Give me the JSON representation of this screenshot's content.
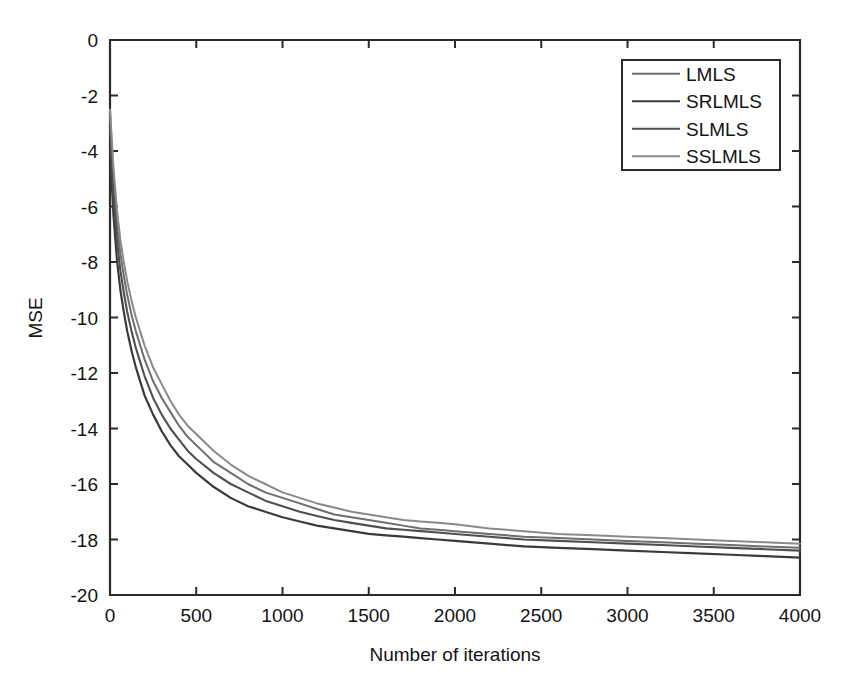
{
  "chart_data": {
    "type": "line",
    "title": "",
    "xlabel": "Number of iterations",
    "ylabel": "MSE",
    "xlim": [
      0,
      4000
    ],
    "ylim": [
      -20,
      0
    ],
    "xticks": [
      0,
      500,
      1000,
      1500,
      2000,
      2500,
      3000,
      3500,
      4000
    ],
    "xtick_labels": [
      "0",
      "500",
      "1000",
      "1500",
      "2000",
      "2500",
      "3000",
      "3500",
      "4000"
    ],
    "yticks": [
      0,
      -2,
      -4,
      -6,
      -8,
      -10,
      -12,
      -14,
      -16,
      -18,
      -20
    ],
    "ytick_labels": [
      "0",
      "-2",
      "-4",
      "-6",
      "-8",
      "-10",
      "-12",
      "-14",
      "-16",
      "-18",
      "-20"
    ],
    "grid": false,
    "legend_position": "upper right",
    "x": [
      0,
      20,
      40,
      60,
      80,
      100,
      125,
      150,
      175,
      200,
      250,
      300,
      350,
      400,
      450,
      500,
      600,
      700,
      800,
      900,
      1000,
      1100,
      1200,
      1300,
      1400,
      1500,
      1600,
      1700,
      1800,
      1900,
      2000,
      2200,
      2400,
      2600,
      2800,
      3000,
      3200,
      3400,
      3600,
      3800,
      4000
    ],
    "series": [
      {
        "name": "LMLS",
        "color": "#6e6e6e",
        "width": 2.0,
        "values": [
          -2.6,
          -5.0,
          -6.6,
          -7.7,
          -8.5,
          -9.2,
          -9.9,
          -10.5,
          -11.0,
          -11.5,
          -12.3,
          -12.9,
          -13.4,
          -13.9,
          -14.3,
          -14.6,
          -15.2,
          -15.6,
          -16.0,
          -16.3,
          -16.5,
          -16.7,
          -16.9,
          -17.1,
          -17.2,
          -17.3,
          -17.4,
          -17.5,
          -17.6,
          -17.65,
          -17.7,
          -17.8,
          -17.9,
          -17.95,
          -18.0,
          -18.05,
          -18.1,
          -18.15,
          -18.2,
          -18.25,
          -18.3
        ]
      },
      {
        "name": "SRLMLS",
        "color": "#3a3a3a",
        "width": 2.2,
        "values": [
          -3.9,
          -6.3,
          -7.9,
          -9.0,
          -9.8,
          -10.5,
          -11.2,
          -11.8,
          -12.3,
          -12.8,
          -13.5,
          -14.1,
          -14.6,
          -15.0,
          -15.3,
          -15.6,
          -16.1,
          -16.5,
          -16.8,
          -17.0,
          -17.2,
          -17.35,
          -17.5,
          -17.6,
          -17.7,
          -17.8,
          -17.85,
          -17.9,
          -17.95,
          -18.0,
          -18.05,
          -18.15,
          -18.25,
          -18.3,
          -18.35,
          -18.4,
          -18.45,
          -18.5,
          -18.55,
          -18.6,
          -18.65
        ]
      },
      {
        "name": "SLMLS",
        "color": "#4f4f4f",
        "width": 2.1,
        "values": [
          -3.2,
          -5.6,
          -7.2,
          -8.3,
          -9.1,
          -9.8,
          -10.5,
          -11.1,
          -11.6,
          -12.1,
          -12.9,
          -13.5,
          -14.0,
          -14.4,
          -14.8,
          -15.1,
          -15.6,
          -16.0,
          -16.3,
          -16.6,
          -16.8,
          -17.0,
          -17.15,
          -17.3,
          -17.4,
          -17.5,
          -17.6,
          -17.65,
          -17.7,
          -17.75,
          -17.8,
          -17.9,
          -18.0,
          -18.05,
          -18.1,
          -18.15,
          -18.2,
          -18.25,
          -18.3,
          -18.35,
          -18.4
        ]
      },
      {
        "name": "SSLMLS",
        "color": "#8a8a8a",
        "width": 2.0,
        "values": [
          -2.5,
          -4.6,
          -6.1,
          -7.2,
          -8.0,
          -8.7,
          -9.4,
          -10.0,
          -10.5,
          -11.0,
          -11.8,
          -12.4,
          -13.0,
          -13.5,
          -13.9,
          -14.2,
          -14.8,
          -15.3,
          -15.7,
          -16.0,
          -16.3,
          -16.5,
          -16.7,
          -16.85,
          -17.0,
          -17.1,
          -17.2,
          -17.3,
          -17.35,
          -17.4,
          -17.45,
          -17.6,
          -17.7,
          -17.8,
          -17.85,
          -17.9,
          -17.95,
          -18.0,
          -18.05,
          -18.1,
          -18.15
        ]
      }
    ]
  },
  "legend": {
    "items": [
      {
        "label": "LMLS"
      },
      {
        "label": "SRLMLS"
      },
      {
        "label": "SLMLS"
      },
      {
        "label": "SSLMLS"
      }
    ]
  }
}
